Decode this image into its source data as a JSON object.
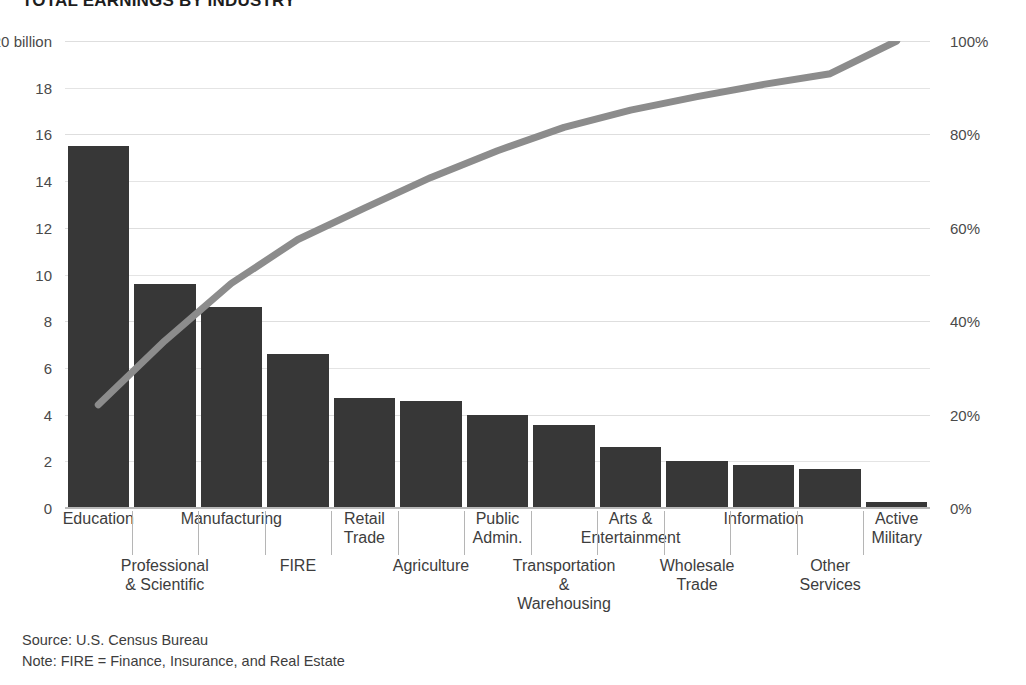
{
  "title": "TOTAL EARNINGS BY INDUSTRY",
  "footer": {
    "source": "Source: U.S. Census Bureau",
    "note": "Note: FIRE = Finance, Insurance, and Real Estate"
  },
  "axes": {
    "left_ticks": [
      "$20 billion",
      "18",
      "16",
      "14",
      "12",
      "10",
      "8",
      "6",
      "4",
      "2",
      "0"
    ],
    "right_ticks": [
      "100%",
      "80%",
      "60%",
      "40%",
      "20%",
      "0%"
    ]
  },
  "colors": {
    "bar": "#373737",
    "line": "#8c8c8c",
    "grid": "#e4e4e4",
    "text": "#3d3d3d",
    "background": "#ffffff"
  },
  "chart_data": {
    "type": "bar",
    "title": "TOTAL EARNINGS BY INDUSTRY",
    "xlabel": "",
    "ylabel": "$20 billion",
    "ylim": [
      0,
      20
    ],
    "y2lim": [
      0,
      100
    ],
    "y2label": "100%",
    "grid": true,
    "legend": "none",
    "categories": [
      "Education",
      "Professional & Scientific",
      "Manufacturing",
      "FIRE",
      "Retail Trade",
      "Agriculture",
      "Public Admin.",
      "Transportation & Warehousing",
      "Arts & Entertainment",
      "Wholesale Trade",
      "Information",
      "Other Services",
      "Active Military"
    ],
    "series": [
      {
        "name": "Total earnings ($ billion)",
        "type": "bar",
        "values": [
          15.5,
          9.6,
          8.6,
          6.6,
          4.7,
          4.6,
          4.0,
          3.55,
          2.6,
          2.0,
          1.85,
          1.65,
          0.25
        ]
      },
      {
        "name": "Cumulative share (%)",
        "type": "line",
        "axis": "right",
        "values": [
          22.1,
          35.8,
          48.1,
          57.5,
          64.2,
          70.8,
          76.5,
          81.5,
          85.2,
          88.1,
          90.7,
          93.0,
          100.0
        ]
      }
    ]
  },
  "x_labels": [
    {
      "label": "Education",
      "row": 0
    },
    {
      "label": "Professional\n& Scientific",
      "row": 1
    },
    {
      "label": "Manufacturing",
      "row": 0
    },
    {
      "label": "FIRE",
      "row": 1
    },
    {
      "label": "Retail\nTrade",
      "row": 0
    },
    {
      "label": "Agriculture",
      "row": 1
    },
    {
      "label": "Public\nAdmin.",
      "row": 0
    },
    {
      "label": "Transportation\n&\nWarehousing",
      "row": 1
    },
    {
      "label": "Arts &\nEntertainment",
      "row": 0
    },
    {
      "label": "Wholesale\nTrade",
      "row": 1
    },
    {
      "label": "Information",
      "row": 0
    },
    {
      "label": "Other\nServices",
      "row": 1
    },
    {
      "label": "Active\nMilitary",
      "row": 0
    }
  ]
}
